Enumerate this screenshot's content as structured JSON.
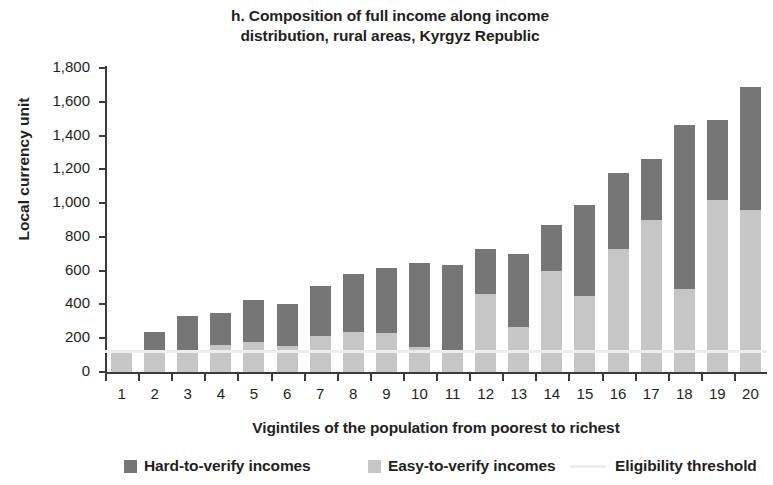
{
  "chart_data": {
    "type": "bar",
    "stacked": true,
    "title": "h. Composition of full income along income distribution, rural areas, Kyrgyz Republic",
    "title_lines": [
      "h. Composition of full income along income",
      "distribution, rural areas, Kyrgyz Republic"
    ],
    "xlabel": "Vigintiles of the population from poorest to richest",
    "ylabel": "Local currency unit",
    "categories": [
      "1",
      "2",
      "3",
      "4",
      "5",
      "6",
      "7",
      "8",
      "9",
      "10",
      "11",
      "12",
      "13",
      "14",
      "15",
      "16",
      "17",
      "18",
      "19",
      "20"
    ],
    "ylim": [
      0,
      1800
    ],
    "yticks": [
      0,
      200,
      400,
      600,
      800,
      1000,
      1200,
      1400,
      1600,
      1800
    ],
    "ytick_labels": [
      "0",
      "200",
      "400",
      "600",
      "800",
      "1,000",
      "1,200",
      "1,400",
      "1,600",
      "1,800"
    ],
    "grid": false,
    "legend_position": "bottom",
    "series": [
      {
        "name": "Easy-to-verify incomes",
        "color": "#c6c6c6",
        "values": [
          120,
          120,
          125,
          160,
          175,
          155,
          215,
          235,
          230,
          150,
          125,
          460,
          265,
          600,
          450,
          730,
          900,
          490,
          1020,
          960
        ]
      },
      {
        "name": "Hard-to-verify incomes",
        "color": "#767676",
        "values": [
          0,
          115,
          205,
          190,
          250,
          245,
          295,
          345,
          385,
          495,
          510,
          270,
          435,
          270,
          540,
          450,
          360,
          975,
          470,
          725
        ]
      }
    ],
    "totals": [
      120,
      235,
      330,
      350,
      425,
      400,
      510,
      580,
      615,
      645,
      635,
      730,
      700,
      870,
      990,
      1180,
      1260,
      1465,
      1490,
      1685
    ],
    "threshold": {
      "name": "Eligibility threshold",
      "value": 130,
      "color": "#ededed"
    }
  },
  "legend": {
    "items": [
      {
        "label": "Hard-to-verify incomes",
        "marker": "square",
        "color": "#767676"
      },
      {
        "label": "Easy-to-verify incomes",
        "marker": "square",
        "color": "#c6c6c6"
      },
      {
        "label": "Eligibility threshold",
        "marker": "line",
        "color": "#ededed"
      }
    ]
  }
}
